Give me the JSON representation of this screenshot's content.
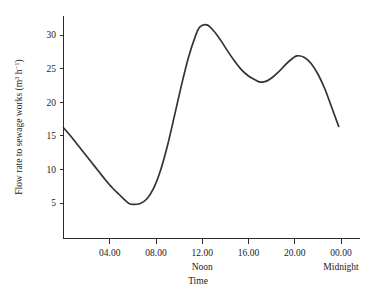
{
  "chart_data": {
    "type": "line",
    "title": "",
    "xlabel": "Time",
    "ylabel": "Flow rate to sewage works (m3 h-1)",
    "ylabel_parts": {
      "prefix": "Flow rate to sewage works (m",
      "sup1": "3",
      "mid": " h",
      "sup2": "−1",
      "suffix": ")"
    },
    "xlim": [
      0,
      24
    ],
    "ylim": [
      0,
      33
    ],
    "grid": false,
    "legend": null,
    "x_ticks": [
      {
        "value": 4,
        "label": "04.00",
        "sub": ""
      },
      {
        "value": 8,
        "label": "08.00",
        "sub": ""
      },
      {
        "value": 12,
        "label": "12.00",
        "sub": "Noon"
      },
      {
        "value": 16,
        "label": "16.00",
        "sub": ""
      },
      {
        "value": 20,
        "label": "20.00",
        "sub": ""
      },
      {
        "value": 24,
        "label": "00.00",
        "sub": "Midnight"
      }
    ],
    "y_ticks": [
      {
        "value": 5,
        "label": "5"
      },
      {
        "value": 10,
        "label": "10"
      },
      {
        "value": 15,
        "label": "15"
      },
      {
        "value": 20,
        "label": "20"
      },
      {
        "value": 25,
        "label": "25"
      },
      {
        "value": 30,
        "label": "30"
      }
    ],
    "series": [
      {
        "name": "Flow rate",
        "x": [
          0.0,
          0.6,
          1.2,
          1.8,
          2.4,
          3.0,
          3.6,
          4.2,
          4.8,
          5.4,
          5.7,
          6.0,
          6.6,
          7.2,
          7.8,
          8.4,
          9.0,
          9.6,
          10.2,
          10.8,
          11.4,
          11.8,
          12.4,
          13.0,
          13.6,
          14.2,
          14.8,
          15.4,
          16.0,
          16.6,
          17.0,
          17.5,
          18.0,
          18.6,
          19.2,
          19.8,
          20.2,
          20.8,
          21.4,
          22.0,
          22.6,
          23.2,
          23.8
        ],
        "y": [
          16.2,
          15.0,
          13.7,
          12.4,
          11.1,
          9.8,
          8.5,
          7.3,
          6.3,
          5.3,
          4.9,
          4.8,
          4.9,
          5.6,
          7.2,
          9.9,
          13.6,
          18.0,
          22.5,
          26.6,
          29.8,
          31.2,
          31.5,
          30.6,
          29.2,
          27.6,
          26.1,
          24.8,
          23.9,
          23.3,
          23.0,
          23.1,
          23.6,
          24.5,
          25.6,
          26.5,
          26.9,
          26.7,
          25.8,
          24.2,
          22.0,
          19.2,
          16.4
        ],
        "color": "#333333"
      }
    ],
    "annotations": [
      {
        "text": "Noon",
        "x": 12,
        "position": "below-axis"
      },
      {
        "text": "Midnight",
        "x": 24,
        "position": "below-axis"
      }
    ],
    "key_points": {
      "start_value": 16.2,
      "morning_minimum": {
        "time": "05:45",
        "value": 4.8
      },
      "midday_peak": {
        "time": "12:15",
        "value": 31.5
      },
      "afternoon_dip": {
        "time": "17:00",
        "value": 23.0
      },
      "evening_peak": {
        "time": "20:10",
        "value": 26.9
      },
      "end_value": 16.4
    },
    "colors": {
      "curve": "#333333",
      "axis": "#2b2b2b",
      "text": "#1a1a1a",
      "background": "#ffffff"
    }
  }
}
